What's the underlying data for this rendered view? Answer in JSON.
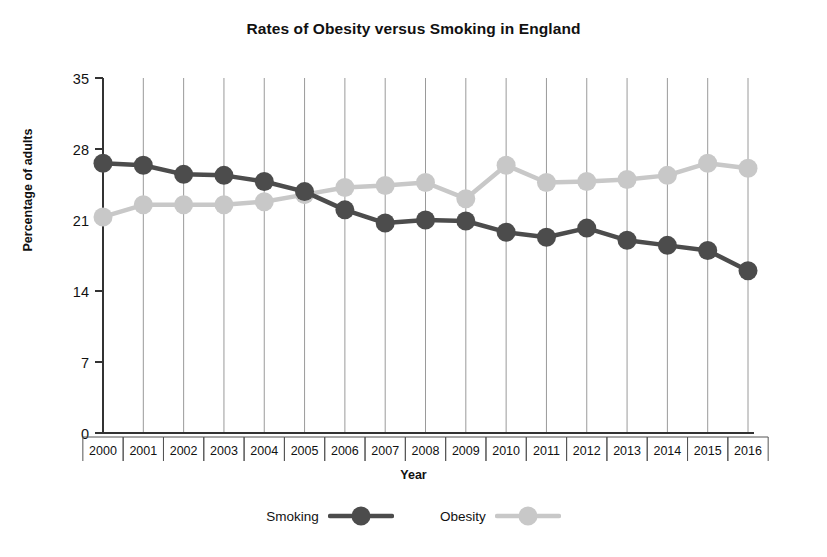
{
  "chart_data": {
    "type": "line",
    "title": "Rates of Obesity versus Smoking in England",
    "xlabel": "Year",
    "ylabel": "Percentage of adults",
    "categories": [
      "2000",
      "2001",
      "2002",
      "2003",
      "2004",
      "2005",
      "2006",
      "2007",
      "2008",
      "2009",
      "2010",
      "2011",
      "2012",
      "2013",
      "2014",
      "2015",
      "2016"
    ],
    "series": [
      {
        "name": "Smoking",
        "color": "#4c4c4c",
        "marker": "circle",
        "values": [
          26.6,
          26.4,
          25.5,
          25.4,
          24.8,
          23.8,
          22.0,
          20.7,
          21.0,
          20.9,
          19.8,
          19.3,
          20.2,
          19.0,
          18.5,
          18.0,
          16.0
        ]
      },
      {
        "name": "Obesity",
        "color": "#c8c8c8",
        "marker": "circle",
        "values": [
          21.3,
          22.5,
          22.5,
          22.5,
          22.8,
          23.5,
          24.2,
          24.4,
          24.7,
          23.1,
          26.4,
          24.7,
          24.8,
          25.0,
          25.4,
          26.6,
          26.1
        ]
      }
    ],
    "ylim": [
      0,
      35
    ],
    "yticks": [
      0,
      7,
      14,
      21,
      28,
      35
    ],
    "grid": "vertical",
    "legend_position": "bottom"
  },
  "legend": {
    "items": [
      {
        "label": "Smoking",
        "color": "#4c4c4c"
      },
      {
        "label": "Obesity",
        "color": "#c8c8c8"
      }
    ]
  }
}
